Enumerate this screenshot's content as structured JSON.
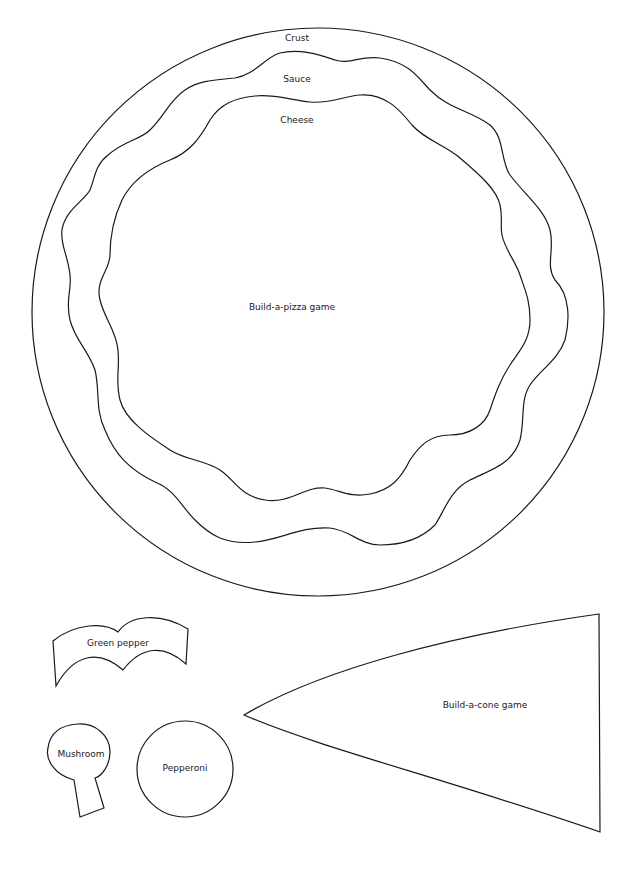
{
  "pizza": {
    "title": "Build-a-pizza game",
    "layers": {
      "crust": "Crust",
      "sauce": "Sauce",
      "cheese": "Cheese"
    }
  },
  "toppings": {
    "green_pepper": "Green pepper",
    "mushroom": "Mushroom",
    "pepperoni": "Pepperoni"
  },
  "cone": {
    "title": "Build-a-cone game"
  },
  "colors": {
    "stroke": "#1a1a1a",
    "background": "#ffffff"
  }
}
